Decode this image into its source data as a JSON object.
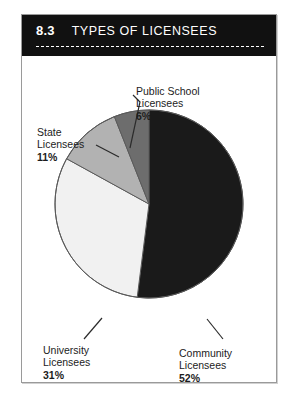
{
  "figure": {
    "number": "8.3",
    "title": "TYPES OF LICENSEES"
  },
  "chart_data": {
    "type": "pie",
    "title": "TYPES OF LICENSEES",
    "categories": [
      "Community Licensees",
      "University Licensees",
      "State Licensees",
      "Public School Licensees"
    ],
    "values": [
      52,
      31,
      11,
      6
    ],
    "value_unit": "%",
    "legend": "none",
    "labels_inline": true,
    "colors": [
      "#1a1a1a",
      "#f1f1f1",
      "#b2b2b2",
      "#6d6d6d"
    ],
    "slices": [
      {
        "name": "Community Licensees",
        "value": 52,
        "label": "52%",
        "color": "#1a1a1a"
      },
      {
        "name": "University Licensees",
        "value": 31,
        "label": "31%",
        "color": "#f1f1f1"
      },
      {
        "name": "State Licensees",
        "value": 11,
        "label": "11%",
        "color": "#b2b2b2"
      },
      {
        "name": "Public School Licensees",
        "value": 6,
        "label": "6%",
        "color": "#6d6d6d"
      }
    ]
  },
  "labels": {
    "public_school": {
      "line1": "Public School",
      "line2": "Licensees",
      "pct": "6%"
    },
    "state": {
      "line1": "State",
      "line2": "Licensees",
      "pct": "11%"
    },
    "university": {
      "line1": "University",
      "line2": "Licensees",
      "pct": "31%"
    },
    "community": {
      "line1": "Community",
      "line2": "Licensees",
      "pct": "52%"
    }
  }
}
